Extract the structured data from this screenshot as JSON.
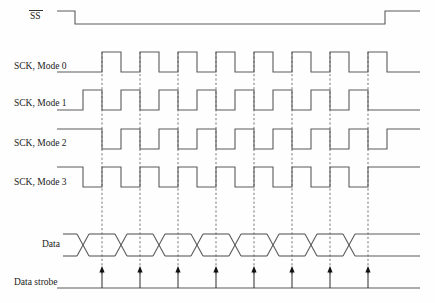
{
  "diagram": {
    "width": 435,
    "height": 303,
    "background_color": "#fefefe",
    "wave_color": "#5a5a5a",
    "grid_color": "#777777",
    "text_color": "#1a1a1a",
    "strobe_color": "#111111"
  },
  "signals": [
    {
      "id": "ss",
      "label": "SS",
      "overline": true,
      "label_x": 30,
      "label_y": 19,
      "row_top": 11,
      "row_bottom": 24,
      "idle_level": "high",
      "description": "Slave select, active low"
    },
    {
      "id": "sck-mode-0",
      "label": "SCK, Mode 0",
      "overline": false,
      "label_x": 14,
      "label_y": 69,
      "row_top": 52,
      "row_bottom": 72,
      "idle_level": "low",
      "cpol": 0,
      "cpha": 0
    },
    {
      "id": "sck-mode-1",
      "label": "SCK, Mode 1",
      "overline": false,
      "label_x": 14,
      "label_y": 106,
      "row_top": 90,
      "row_bottom": 110,
      "idle_level": "low",
      "cpol": 0,
      "cpha": 1
    },
    {
      "id": "sck-mode-2",
      "label": "SCK, Mode 2",
      "overline": false,
      "label_x": 14,
      "label_y": 146,
      "row_top": 129,
      "row_bottom": 149,
      "idle_level": "high",
      "cpol": 1,
      "cpha": 0
    },
    {
      "id": "sck-mode-3",
      "label": "SCK, Mode 3",
      "overline": false,
      "label_x": 14,
      "label_y": 185,
      "row_top": 167,
      "row_bottom": 187,
      "idle_level": "high",
      "cpol": 1,
      "cpha": 1
    },
    {
      "id": "data",
      "label": "Data",
      "overline": false,
      "label_x": 42,
      "label_y": 247,
      "row_top": 234,
      "row_bottom": 256,
      "idle_level": "bus",
      "description": "Data bus with bit cell crossings"
    },
    {
      "id": "data-strobe",
      "label": "Data strobe",
      "overline": false,
      "label_x": 14,
      "label_y": 285,
      "row_top": 266,
      "row_bottom": 288,
      "idle_level": "low",
      "description": "Sampling strobe arrows"
    }
  ],
  "timing": {
    "bit_count": 8,
    "clock_period": 38,
    "half_period": 19,
    "first_edge_x": 102,
    "grid_x_positions": [
      102,
      140,
      178,
      216,
      254,
      292,
      330,
      368
    ],
    "grid_y_top": 52,
    "grid_y_bottom": 276,
    "ss_fall_x": 75,
    "ss_rise_x": 385,
    "wave_start_x": 57,
    "wave_end_x": 420,
    "data_bus_start_x": 63,
    "data_bus_end_x": 420,
    "data_transition_x_positions": [
      83,
      121,
      159,
      197,
      235,
      273,
      311,
      349
    ],
    "data_transition_width": 12,
    "strobe_x_positions": [
      102,
      140,
      178,
      216,
      254,
      292,
      330,
      368
    ],
    "strobe_baseline_y": 288,
    "strobe_tip_y": 266
  },
  "labels": {
    "ss": "SS",
    "mode0": "SCK, Mode 0",
    "mode1": "SCK, Mode 1",
    "mode2": "SCK, Mode 2",
    "mode3": "SCK, Mode 3",
    "data": "Data",
    "data_strobe": "Data strobe"
  }
}
